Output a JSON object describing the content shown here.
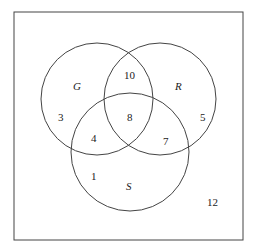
{
  "diagram": {
    "type": "venn",
    "sets": [
      {
        "name": "G",
        "label": "G"
      },
      {
        "name": "R",
        "label": "R"
      },
      {
        "name": "S",
        "label": "S"
      }
    ],
    "regions": {
      "G_only": "3",
      "R_only": "5",
      "S_only": "1",
      "G_R_only": "10",
      "G_S_only": "4",
      "R_S_only": "7",
      "G_R_S": "8",
      "outside": "12"
    },
    "colors": {
      "stroke": "#444444",
      "background": "#ffffff"
    }
  }
}
